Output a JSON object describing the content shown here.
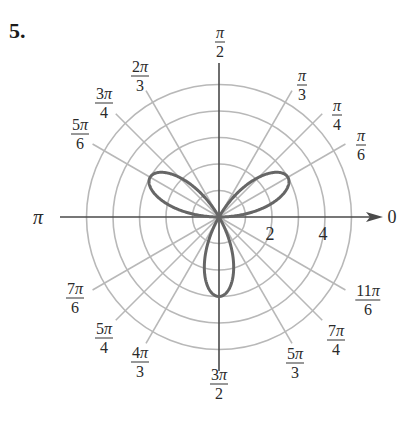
{
  "problem_number": "5.",
  "colors": {
    "grid": "#b8b8b8",
    "axis": "#4a4a4a",
    "curve": "#666666",
    "text": "#2a2a2a"
  },
  "chart_data": {
    "type": "polar",
    "title": "",
    "curve": {
      "equation": "r = 3 sin(3θ)",
      "description": "three-petal rose",
      "petal_length": 3,
      "petal_angles_deg": [
        30,
        150,
        270
      ]
    },
    "radial_rings": [
      1,
      2,
      3,
      4,
      5
    ],
    "radial_tick_labels": [
      {
        "value": 2,
        "label": "2"
      },
      {
        "value": 4,
        "label": "4"
      }
    ],
    "angle_lines_deg": [
      0,
      30,
      45,
      60,
      90,
      120,
      135,
      150,
      180,
      210,
      225,
      240,
      270,
      300,
      315,
      330
    ],
    "angle_labels": [
      {
        "deg": 0,
        "num": "",
        "den": "",
        "text": "0"
      },
      {
        "deg": 30,
        "num": "π",
        "den": "6"
      },
      {
        "deg": 45,
        "num": "π",
        "den": "4"
      },
      {
        "deg": 60,
        "num": "π",
        "den": "3"
      },
      {
        "deg": 90,
        "num": "π",
        "den": "2"
      },
      {
        "deg": 120,
        "num": "2π",
        "den": "3"
      },
      {
        "deg": 135,
        "num": "3π",
        "den": "4"
      },
      {
        "deg": 150,
        "num": "5π",
        "den": "6"
      },
      {
        "deg": 180,
        "num": "",
        "den": "",
        "text": "π"
      },
      {
        "deg": 210,
        "num": "7π",
        "den": "6"
      },
      {
        "deg": 225,
        "num": "5π",
        "den": "4"
      },
      {
        "deg": 240,
        "num": "4π",
        "den": "3"
      },
      {
        "deg": 270,
        "num": "3π",
        "den": "2"
      },
      {
        "deg": 300,
        "num": "5π",
        "den": "3"
      },
      {
        "deg": 315,
        "num": "7π",
        "den": "4"
      },
      {
        "deg": 330,
        "num": "11π",
        "den": "6"
      }
    ],
    "rlim": [
      0,
      5
    ],
    "grid": true,
    "legend": null
  }
}
